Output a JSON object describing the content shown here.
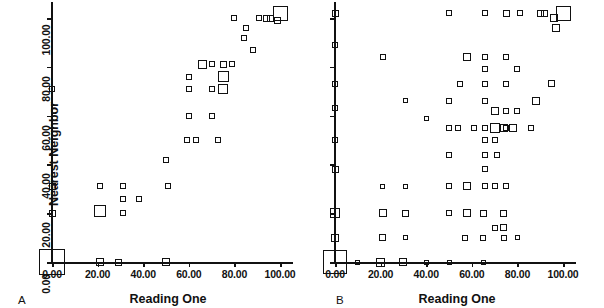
{
  "figure": {
    "y_axis_title": "Nearest Neighbor",
    "panels": [
      {
        "letter": "A",
        "x_axis_title": "Reading One"
      },
      {
        "letter": "B",
        "x_axis_title": "Reading One"
      }
    ]
  },
  "axes": {
    "x_ticks": [
      "0.00",
      "20.00",
      "40.00",
      "60.00",
      "80.00",
      "100.00"
    ],
    "y_ticks": [
      "0.00",
      "20.00",
      "40.00",
      "60.00",
      "80.00",
      "100.00"
    ]
  },
  "chart_data": {
    "type": "scatter",
    "title": "",
    "xlabel": "Reading One",
    "ylabel": "Nearest Neighbor",
    "xlim": [
      0,
      100
    ],
    "ylim": [
      0,
      100
    ],
    "xticks": [
      0,
      20,
      40,
      60,
      80,
      100
    ],
    "yticks": [
      0,
      20,
      40,
      60,
      80,
      100
    ],
    "grid": false,
    "legend": "none",
    "marker": "open-square",
    "marker_size_encodes": "count",
    "panels": [
      {
        "label": "A",
        "xlabel": "Reading One",
        "ylabel": "Nearest Neighbor",
        "points": [
          {
            "x": 0,
            "y": 0,
            "size": 26
          },
          {
            "x": 0,
            "y": 20,
            "size": 7
          },
          {
            "x": 0,
            "y": 31,
            "size": 7
          },
          {
            "x": 0,
            "y": 71,
            "size": 6
          },
          {
            "x": 21,
            "y": 0,
            "size": 8
          },
          {
            "x": 21,
            "y": 21,
            "size": 12
          },
          {
            "x": 21,
            "y": 31,
            "size": 6
          },
          {
            "x": 29,
            "y": 0,
            "size": 7
          },
          {
            "x": 31,
            "y": 20,
            "size": 6
          },
          {
            "x": 31,
            "y": 26,
            "size": 6
          },
          {
            "x": 31,
            "y": 31,
            "size": 6
          },
          {
            "x": 38,
            "y": 26,
            "size": 6
          },
          {
            "x": 50,
            "y": 0,
            "size": 8
          },
          {
            "x": 50,
            "y": 42,
            "size": 6
          },
          {
            "x": 51,
            "y": 31,
            "size": 6
          },
          {
            "x": 59,
            "y": 50,
            "size": 6
          },
          {
            "x": 60,
            "y": 60,
            "size": 6
          },
          {
            "x": 60,
            "y": 71,
            "size": 6
          },
          {
            "x": 60,
            "y": 76,
            "size": 6
          },
          {
            "x": 63,
            "y": 50,
            "size": 6
          },
          {
            "x": 66,
            "y": 81,
            "size": 9
          },
          {
            "x": 70,
            "y": 60,
            "size": 6
          },
          {
            "x": 70,
            "y": 71,
            "size": 6
          },
          {
            "x": 70,
            "y": 81,
            "size": 6
          },
          {
            "x": 73,
            "y": 50,
            "size": 6
          },
          {
            "x": 75,
            "y": 71,
            "size": 10
          },
          {
            "x": 75,
            "y": 76,
            "size": 11
          },
          {
            "x": 75,
            "y": 81,
            "size": 7
          },
          {
            "x": 79,
            "y": 81,
            "size": 6
          },
          {
            "x": 80,
            "y": 100,
            "size": 6
          },
          {
            "x": 84,
            "y": 92,
            "size": 6
          },
          {
            "x": 85,
            "y": 96,
            "size": 6
          },
          {
            "x": 88,
            "y": 87,
            "size": 6
          },
          {
            "x": 91,
            "y": 100,
            "size": 6
          },
          {
            "x": 94,
            "y": 100,
            "size": 7
          },
          {
            "x": 96,
            "y": 100,
            "size": 7
          },
          {
            "x": 99,
            "y": 99,
            "size": 7
          },
          {
            "x": 100,
            "y": 102,
            "size": 15
          }
        ]
      },
      {
        "label": "B",
        "xlabel": "Reading One",
        "ylabel": "Nearest Neighbor",
        "points": [
          {
            "x": 0,
            "y": 0,
            "size": 24
          },
          {
            "x": 0,
            "y": 10,
            "size": 8
          },
          {
            "x": 0,
            "y": 20,
            "size": 10
          },
          {
            "x": 0,
            "y": 38,
            "size": 7
          },
          {
            "x": 0,
            "y": 50,
            "size": 6
          },
          {
            "x": 0,
            "y": 63,
            "size": 6
          },
          {
            "x": 0,
            "y": 73,
            "size": 6
          },
          {
            "x": 0,
            "y": 89,
            "size": 6
          },
          {
            "x": 0,
            "y": 102,
            "size": 7
          },
          {
            "x": 10,
            "y": 0,
            "size": 5
          },
          {
            "x": 20,
            "y": 0,
            "size": 9
          },
          {
            "x": 21,
            "y": 10,
            "size": 7
          },
          {
            "x": 21,
            "y": 20,
            "size": 8
          },
          {
            "x": 21,
            "y": 31,
            "size": 5
          },
          {
            "x": 21,
            "y": 84,
            "size": 6
          },
          {
            "x": 30,
            "y": 0,
            "size": 8
          },
          {
            "x": 31,
            "y": 10,
            "size": 5
          },
          {
            "x": 31,
            "y": 20,
            "size": 7
          },
          {
            "x": 31,
            "y": 31,
            "size": 5
          },
          {
            "x": 31,
            "y": 66,
            "size": 5
          },
          {
            "x": 40,
            "y": 0,
            "size": 5
          },
          {
            "x": 40,
            "y": 59,
            "size": 5
          },
          {
            "x": 50,
            "y": 0,
            "size": 5
          },
          {
            "x": 50,
            "y": 20,
            "size": 6
          },
          {
            "x": 50,
            "y": 31,
            "size": 6
          },
          {
            "x": 50,
            "y": 44,
            "size": 6
          },
          {
            "x": 50,
            "y": 55,
            "size": 6
          },
          {
            "x": 50,
            "y": 66,
            "size": 6
          },
          {
            "x": 50,
            "y": 102,
            "size": 6
          },
          {
            "x": 54,
            "y": 55,
            "size": 6
          },
          {
            "x": 55,
            "y": 73,
            "size": 6
          },
          {
            "x": 57,
            "y": 10,
            "size": 6
          },
          {
            "x": 58,
            "y": 20,
            "size": 8
          },
          {
            "x": 58,
            "y": 31,
            "size": 8
          },
          {
            "x": 58,
            "y": 84,
            "size": 8
          },
          {
            "x": 61,
            "y": 55,
            "size": 6
          },
          {
            "x": 65,
            "y": 0,
            "size": 5
          },
          {
            "x": 65,
            "y": 10,
            "size": 6
          },
          {
            "x": 65,
            "y": 20,
            "size": 7
          },
          {
            "x": 66,
            "y": 31,
            "size": 6
          },
          {
            "x": 66,
            "y": 38,
            "size": 6
          },
          {
            "x": 66,
            "y": 44,
            "size": 6
          },
          {
            "x": 66,
            "y": 50,
            "size": 6
          },
          {
            "x": 66,
            "y": 55,
            "size": 6
          },
          {
            "x": 66,
            "y": 66,
            "size": 6
          },
          {
            "x": 66,
            "y": 73,
            "size": 6
          },
          {
            "x": 66,
            "y": 79,
            "size": 6
          },
          {
            "x": 66,
            "y": 84,
            "size": 6
          },
          {
            "x": 66,
            "y": 102,
            "size": 6
          },
          {
            "x": 70,
            "y": 14,
            "size": 6
          },
          {
            "x": 70,
            "y": 31,
            "size": 6
          },
          {
            "x": 70,
            "y": 50,
            "size": 6
          },
          {
            "x": 70,
            "y": 55,
            "size": 10
          },
          {
            "x": 70,
            "y": 62,
            "size": 8
          },
          {
            "x": 71,
            "y": 44,
            "size": 6
          },
          {
            "x": 74,
            "y": 10,
            "size": 6
          },
          {
            "x": 74,
            "y": 14,
            "size": 7
          },
          {
            "x": 74,
            "y": 20,
            "size": 7
          },
          {
            "x": 74,
            "y": 55,
            "size": 8
          },
          {
            "x": 75,
            "y": 31,
            "size": 6
          },
          {
            "x": 75,
            "y": 55,
            "size": 6
          },
          {
            "x": 75,
            "y": 62,
            "size": 6
          },
          {
            "x": 75,
            "y": 73,
            "size": 6
          },
          {
            "x": 75,
            "y": 84,
            "size": 6
          },
          {
            "x": 75,
            "y": 102,
            "size": 7
          },
          {
            "x": 78,
            "y": 55,
            "size": 8
          },
          {
            "x": 80,
            "y": 10,
            "size": 5
          },
          {
            "x": 80,
            "y": 62,
            "size": 6
          },
          {
            "x": 80,
            "y": 79,
            "size": 6
          },
          {
            "x": 81,
            "y": 102,
            "size": 6
          },
          {
            "x": 86,
            "y": 55,
            "size": 6
          },
          {
            "x": 88,
            "y": 66,
            "size": 8
          },
          {
            "x": 90,
            "y": 102,
            "size": 7
          },
          {
            "x": 92,
            "y": 102,
            "size": 7
          },
          {
            "x": 95,
            "y": 73,
            "size": 7
          },
          {
            "x": 96,
            "y": 100,
            "size": 8
          },
          {
            "x": 97,
            "y": 96,
            "size": 8
          },
          {
            "x": 100,
            "y": 102,
            "size": 15
          }
        ]
      }
    ]
  }
}
